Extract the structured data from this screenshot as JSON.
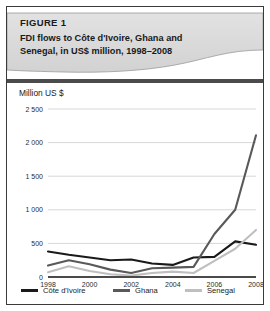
{
  "figure": {
    "label": "FIGURE 1",
    "caption_line1": "FDI flows to Côte d'Ivoire, Ghana and",
    "caption_line2": "Senegal, in US$ million, 1998–2008"
  },
  "chart_data": {
    "type": "line",
    "title": "FDI flows to Côte d'Ivoire, Ghana and Senegal, in US$ million, 1998–2008",
    "axis_title": "Million US $",
    "xlabel": "",
    "ylabel": "Million US $",
    "x": [
      1998,
      1999,
      2000,
      2001,
      2002,
      2003,
      2004,
      2005,
      2006,
      2007,
      2008
    ],
    "categories": [
      "1998",
      "1999",
      "2000",
      "2001",
      "2002",
      "2003",
      "2004",
      "2005",
      "2006",
      "2007",
      "2008"
    ],
    "xtick_labels": [
      "1998",
      "2000",
      "2002",
      "2004",
      "2006",
      "2008"
    ],
    "xtick_values": [
      1998,
      2000,
      2002,
      2004,
      2006,
      2008
    ],
    "ytick_labels": [
      "0",
      "500",
      "1 000",
      "1 500",
      "2 000",
      "2 500"
    ],
    "ytick_values": [
      0,
      500,
      1000,
      1500,
      2000,
      2500
    ],
    "ylim": [
      0,
      2500
    ],
    "xlim": [
      1998,
      2008
    ],
    "grid": true,
    "legend_position": "bottom",
    "series": [
      {
        "name": "Côte d'Ivoire",
        "color": "#1a1a1a",
        "values": [
          380,
          330,
          290,
          250,
          260,
          200,
          180,
          290,
          300,
          530,
          480
        ]
      },
      {
        "name": "Ghana",
        "color": "#595959",
        "values": [
          170,
          250,
          190,
          110,
          60,
          130,
          140,
          150,
          640,
          1000,
          2110
        ]
      },
      {
        "name": "Senegal",
        "color": "#bfbfbf",
        "values": [
          70,
          160,
          90,
          40,
          20,
          60,
          80,
          60,
          240,
          420,
          700
        ]
      }
    ]
  }
}
